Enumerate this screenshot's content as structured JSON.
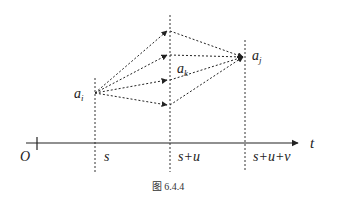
{
  "diagram": {
    "caption": "图 6.4.4",
    "axis": {
      "label": "t",
      "origin_label": "O",
      "time_labels": [
        "s",
        "s+u",
        "s+u+v"
      ]
    },
    "nodes": {
      "start": {
        "label": "a",
        "sub": "i"
      },
      "middle": {
        "label": "a",
        "sub": "k"
      },
      "end": {
        "label": "a",
        "sub": "j"
      }
    },
    "paths_count": 4,
    "colors": {
      "line": "#222222",
      "background": "#ffffff"
    }
  }
}
